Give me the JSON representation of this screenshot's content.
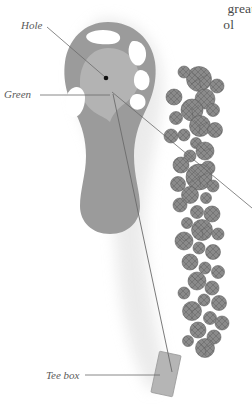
{
  "page": {
    "kind": "golf-hole-diagram",
    "background_color": "#ffffff"
  },
  "body_text": {
    "line_1": "great",
    "line_2": "ol"
  },
  "callouts": [
    {
      "id": "hole",
      "label": "Hole",
      "leader_from": [
        46,
        26
      ],
      "leader_to": [
        106,
        78
      ]
    },
    {
      "id": "green",
      "label": "Green",
      "leader_from": [
        40,
        95
      ],
      "leader_to": [
        110,
        95
      ]
    },
    {
      "id": "tee-box",
      "label": "Tee box",
      "leader_from": [
        84,
        375
      ],
      "leader_to": [
        160,
        375
      ]
    }
  ],
  "features": {
    "hole": {
      "name": "hole-marker",
      "center": [
        106,
        78
      ],
      "radius": 2.2,
      "color": "#111111"
    },
    "green": {
      "name": "putting-green",
      "fill": "#b3b3b3",
      "rough_fill": "#9b9b9b"
    },
    "fairway": {
      "name": "fairway",
      "fill": "#9b9b9b"
    },
    "tee_box": {
      "name": "tee-box-rect",
      "fill": "#b5b5b5",
      "stroke": "#8d8d8d",
      "rotation_deg": 12
    },
    "bunkers": {
      "name": "sand-bunkers",
      "fill": "#ffffff",
      "count": 5
    },
    "trees": {
      "name": "tree-cluster",
      "fill": "#8a8a8a",
      "stroke": "#5c5c5c",
      "count": 46
    }
  },
  "lines": {
    "play_line": {
      "name": "line-of-play",
      "from": [
        113,
        95
      ],
      "to": [
        172,
        370
      ],
      "color": "#6b6b6b"
    },
    "right_leader": {
      "name": "right-leader-line",
      "from": [
        112,
        92
      ],
      "to": [
        252,
        205
      ],
      "color": "#6b6b6b"
    }
  },
  "colors": {
    "rough": "#9b9b9b",
    "green": "#b3b3b3",
    "sand": "#ffffff",
    "tree": "#8a8a8a",
    "tree_edge": "#5c5c5c",
    "tee": "#b5b5b5",
    "line": "#6b6b6b",
    "text": "#4a4a4a",
    "label": "#5a5a5a"
  }
}
